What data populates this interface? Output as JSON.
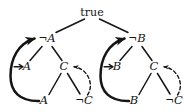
{
  "figure": {
    "name": "proof-tree-diagram",
    "background_color": "#ffffff",
    "ink_color": "#151515",
    "width": 184,
    "height": 112
  },
  "nodes": {
    "root": {
      "text": "true",
      "x": 92,
      "y": 12
    },
    "left": {
      "not_a_top": {
        "neg": "¬",
        "var": "A",
        "x": 47,
        "y": 39
      },
      "a_mid": {
        "text": "A",
        "x": 27,
        "y": 67
      },
      "c_mid": {
        "text": "C",
        "x": 64,
        "y": 67
      },
      "a_bottom": {
        "text": "A",
        "x": 44,
        "y": 101
      },
      "not_c_bottom": {
        "neg": "¬",
        "var": "C",
        "x": 84,
        "y": 101
      }
    },
    "right": {
      "not_b_top": {
        "neg": "¬",
        "var": "B",
        "x": 137,
        "y": 39
      },
      "b_mid": {
        "text": "B",
        "x": 117,
        "y": 67
      },
      "c_mid": {
        "text": "C",
        "x": 154,
        "y": 67
      },
      "b_bottom": {
        "text": "B",
        "x": 134,
        "y": 101
      },
      "not_c_bottom": {
        "neg": "¬",
        "var": "C",
        "x": 174,
        "y": 101
      }
    }
  },
  "edges": {
    "tree_edges": [
      {
        "name": "root-to-not-a",
        "style": "solid"
      },
      {
        "name": "root-to-not-b",
        "style": "solid"
      },
      {
        "name": "not-a-to-a",
        "style": "solid"
      },
      {
        "name": "not-a-to-c",
        "style": "solid"
      },
      {
        "name": "c-to-a-bottom",
        "style": "solid"
      },
      {
        "name": "c-to-not-c",
        "style": "solid"
      },
      {
        "name": "not-b-to-b",
        "style": "solid"
      },
      {
        "name": "not-b-to-c",
        "style": "solid"
      },
      {
        "name": "c-to-b-bottom",
        "style": "solid"
      },
      {
        "name": "c-to-not-c-right",
        "style": "solid"
      }
    ],
    "back_edges": [
      {
        "name": "left-backjump-arc",
        "style": "solid-thick-curved",
        "arrowhead": "into-not-a"
      },
      {
        "name": "left-dashed-backedge",
        "style": "dashed-curved",
        "arrowhead": "into-c"
      },
      {
        "name": "right-backjump-arc",
        "style": "solid-thick-curved",
        "arrowhead": "into-not-b"
      },
      {
        "name": "right-dashed-backedge",
        "style": "dashed-curved",
        "arrowhead": "into-c"
      }
    ]
  }
}
